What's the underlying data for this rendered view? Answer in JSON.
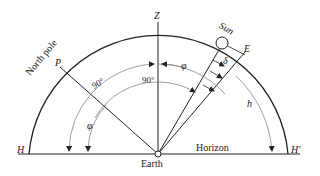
{
  "labels": {
    "zenith": "Z",
    "sun": "Sun",
    "equator_point": "E",
    "north_pole": "North pole",
    "pole_point": "P",
    "horizon_left": "H",
    "horizon_right": "H'",
    "horizon": "Horizon",
    "earth": "Earth",
    "angle_90_outer": "90°",
    "angle_90_inner": "90°",
    "phi_top": "φ",
    "phi_left": "φ",
    "delta": "δ",
    "h": "h"
  },
  "colors": {
    "line": "#222222",
    "arc_gray": "#777777"
  }
}
